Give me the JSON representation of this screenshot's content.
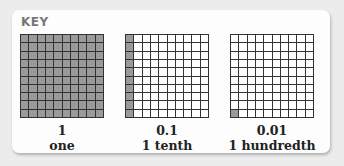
{
  "key": {
    "title": "KEY",
    "items": [
      {
        "value": "1",
        "name": "one",
        "shaded_cells": 100,
        "grid": "10x10"
      },
      {
        "value": "0.1",
        "name": "1 tenth",
        "shaded_cells": 10,
        "shaded_region": "left column",
        "grid": "10x10"
      },
      {
        "value": "0.01",
        "name": "1 hundredth",
        "shaded_cells": 1,
        "shaded_region": "bottom-left cell",
        "grid": "10x10"
      }
    ]
  },
  "colors": {
    "shaded": "#9a9a9a",
    "unshaded": "#ffffff",
    "gridline": "#333333",
    "title": "#777777"
  }
}
